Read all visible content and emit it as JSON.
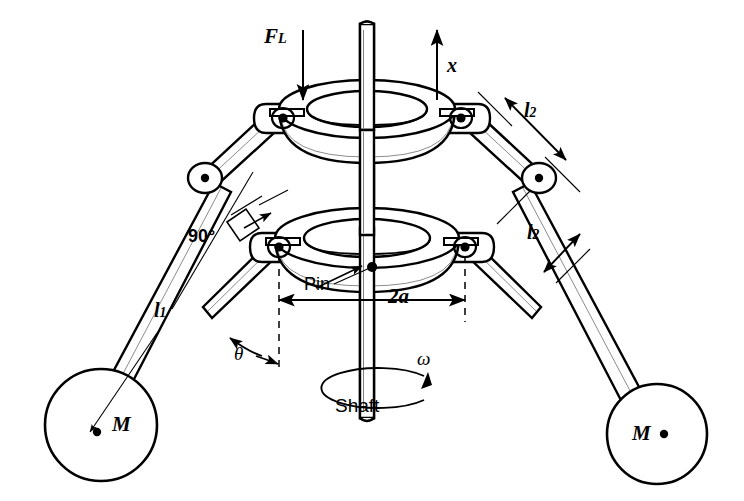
{
  "figure": {
    "kind": "engineering-line-drawing",
    "background_color": "#ffffff",
    "stroke_color": "#000000",
    "width": 744,
    "height": 501
  },
  "labels": {
    "lift_force": "F",
    "lift_force_subscript": "L",
    "displacement": "x",
    "link_upper_right": "l",
    "link_upper_right_subscript": "2",
    "link_lower_right": "l",
    "link_lower_right_subscript": "2",
    "arm_left": "l",
    "arm_left_subscript": "1",
    "right_angle": "90°",
    "pin": "Pin",
    "half_span": "2a",
    "theta": "θ",
    "omega": "ω",
    "shaft": "Shaft",
    "mass_left": "M",
    "mass_right": "M"
  },
  "annotations": [
    {
      "name": "lift-force-arrow",
      "text": "F_L",
      "direction": "down",
      "target": "upper sliding collar"
    },
    {
      "name": "displacement-arrow",
      "text": "x",
      "direction": "up",
      "target": "vertical travel of upper collar"
    },
    {
      "name": "link-dimension-upper-right",
      "text": "l_2",
      "style": "double-headed",
      "target": "upper right link"
    },
    {
      "name": "link-dimension-lower-right",
      "text": "l_2",
      "style": "double-headed",
      "target": "lower right link"
    },
    {
      "name": "arm-dimension-left",
      "text": "l_1",
      "style": "leader",
      "target": "left ball arm to mass center"
    },
    {
      "name": "right-angle-marker",
      "text": "90°",
      "style": "leader",
      "target": "arm/link junction"
    },
    {
      "name": "pin-callout",
      "text": "Pin",
      "style": "leader",
      "target": "lower collar pin"
    },
    {
      "name": "span-dimension",
      "text": "2a",
      "style": "double-headed",
      "target": "distance between lower pivots"
    },
    {
      "name": "theta-angle",
      "text": "θ",
      "style": "double-headed-arc",
      "target": "angle between arm and shaft axis"
    },
    {
      "name": "omega-rotation",
      "text": "ω",
      "style": "curved-arrow",
      "target": "shaft rotation direction"
    },
    {
      "name": "shaft-callout",
      "text": "Shaft",
      "style": "plain",
      "target": "vertical shaft"
    }
  ]
}
